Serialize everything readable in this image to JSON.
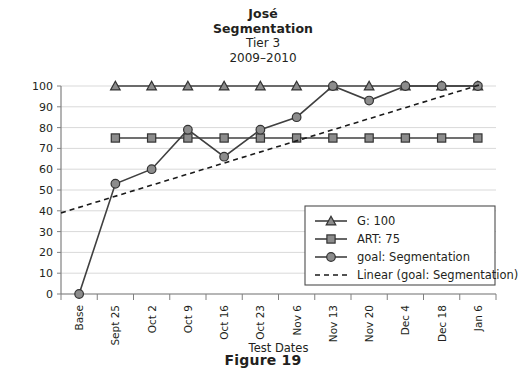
{
  "title": {
    "line1": "José",
    "line2": "Segmentation",
    "line3": "Tier 3",
    "line4": "2009–2010"
  },
  "caption": "Figure 19",
  "axis": {
    "x_title": "Test Dates",
    "y_title": ""
  },
  "legend": {
    "items": [
      {
        "label": "G: 100",
        "marker": "triangle-marker",
        "style": "solid"
      },
      {
        "label": "ART: 75",
        "marker": "square-marker",
        "style": "solid"
      },
      {
        "label": "goal: Segmentation",
        "marker": "circle-marker",
        "style": "solid"
      },
      {
        "label": "Linear (goal: Segmentation)",
        "marker": "none",
        "style": "dashed"
      }
    ]
  },
  "colors": {
    "marker_fill": "#8c8c8c",
    "marker_stroke": "#333333",
    "line": "#404040",
    "gridline": "#d9d9d9",
    "axis": "#808080",
    "text": "#231f20",
    "background": "#ffffff"
  },
  "chart_data": {
    "type": "line",
    "title": "José Segmentation Tier 3 2009–2010",
    "xlabel": "Test Dates",
    "ylabel": "",
    "ylim": [
      0,
      100
    ],
    "yticks": [
      0,
      10,
      20,
      30,
      40,
      50,
      60,
      70,
      80,
      90,
      100
    ],
    "grid": true,
    "legend_position": "lower-right-inside",
    "categories": [
      "Base",
      "Sept 25",
      "Oct 2",
      "Oct 9",
      "Oct 16",
      "Oct 23",
      "Nov 6",
      "Nov 13",
      "Nov 20",
      "Dec 4",
      "Dec 18",
      "Jan 6"
    ],
    "series": [
      {
        "name": "G: 100",
        "marker": "triangle",
        "style": "solid",
        "values": [
          null,
          100,
          100,
          100,
          100,
          100,
          100,
          100,
          100,
          100,
          100,
          100
        ]
      },
      {
        "name": "ART: 75",
        "marker": "square",
        "style": "solid",
        "values": [
          null,
          75,
          75,
          75,
          75,
          75,
          75,
          75,
          75,
          75,
          75,
          75
        ]
      },
      {
        "name": "goal: Segmentation",
        "marker": "circle",
        "style": "solid",
        "values": [
          0,
          53,
          60,
          79,
          66,
          79,
          85,
          100,
          93,
          100,
          100,
          100
        ]
      },
      {
        "name": "Linear (goal: Segmentation)",
        "marker": "none",
        "style": "dashed",
        "trendline": true,
        "endpoints": [
          {
            "x_index": 0,
            "value": 39
          },
          {
            "x_index": 11,
            "value": 101
          }
        ]
      }
    ]
  }
}
